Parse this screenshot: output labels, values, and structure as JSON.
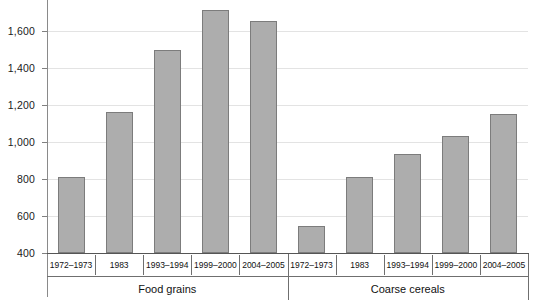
{
  "chart_data": {
    "type": "bar",
    "title": "",
    "subtitle": "",
    "xlabel": "",
    "ylabel": "",
    "ylim": [
      400,
      1700
    ],
    "yticks": [
      400,
      600,
      800,
      1000,
      1200,
      1400,
      1600
    ],
    "ytick_labels": [
      "400",
      "600",
      "800",
      "1,000",
      "1,200",
      "1,400",
      "1,600"
    ],
    "grid": true,
    "legend": "none",
    "bar_color": "#adadad",
    "bar_border_color": "#7c7c7c",
    "gridline_color": "#e3e3e3",
    "axis_color": "#555555",
    "groups": [
      {
        "name": "Food grains",
        "categories": [
          "1972–1973",
          "1983",
          "1993–1994",
          "1999–2000",
          "2004–2005"
        ],
        "values": [
          810,
          1160,
          1500,
          1715,
          1655
        ]
      },
      {
        "name": "Coarse cereals",
        "categories": [
          "1972–1973",
          "1983",
          "1993–1994",
          "1999–2000",
          "2004–2005"
        ],
        "values": [
          545,
          810,
          935,
          1030,
          1150
        ]
      }
    ],
    "categories": [
      "1972–1973",
      "1983",
      "1993–1994",
      "1999–2000",
      "2004–2005",
      "1972–1973",
      "1983",
      "1993–1994",
      "1999–2000",
      "2004–2005"
    ],
    "values": [
      810,
      1160,
      1500,
      1715,
      1655,
      545,
      810,
      935,
      1030,
      1150
    ]
  }
}
